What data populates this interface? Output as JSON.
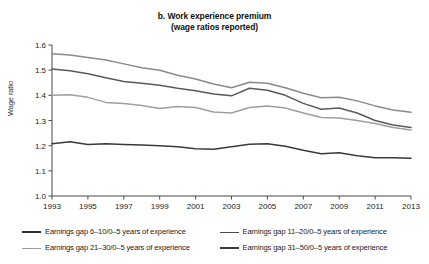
{
  "figure": {
    "title_lines": [
      "b. Work experience premium",
      "(wage ratios reported)"
    ]
  },
  "chart_data": {
    "type": "line",
    "title": "b. Work experience premium (wage ratios reported)",
    "xlabel": "",
    "ylabel": "Wage ratio",
    "xlim": [
      1993,
      2013
    ],
    "ylim": [
      1.0,
      1.6
    ],
    "grid": false,
    "legend_position": "bottom",
    "x": [
      1993,
      1994,
      1995,
      1996,
      1997,
      1998,
      1999,
      2000,
      2001,
      2002,
      2003,
      2004,
      2005,
      2006,
      2007,
      2008,
      2009,
      2010,
      2011,
      2012,
      2013
    ],
    "xticks": [
      1993,
      1995,
      1997,
      1999,
      2001,
      2003,
      2005,
      2007,
      2009,
      2011,
      2013
    ],
    "xtick_labels": [
      "1993",
      "1995",
      "1997",
      "1999",
      "2001",
      "2003",
      "2005",
      "2007",
      "2009",
      "2011",
      "2013"
    ],
    "yticks": [
      1.0,
      1.1,
      1.2,
      1.3,
      1.4,
      1.5,
      1.6
    ],
    "ytick_labels": [
      "1.0",
      "1.1",
      "1.2",
      "1.3",
      "1.4",
      "1.5",
      "1.6"
    ],
    "series": [
      {
        "name": "Earnings gap 6–10/0–5 years of experience",
        "color": "#8a8a8a",
        "width": 1.5,
        "values": [
          1.565,
          1.56,
          1.55,
          1.54,
          1.525,
          1.51,
          1.5,
          1.48,
          1.465,
          1.445,
          1.43,
          1.452,
          1.448,
          1.43,
          1.408,
          1.39,
          1.392,
          1.378,
          1.358,
          1.342,
          1.333
        ]
      },
      {
        "name": "Earnings gap 11–20/0–5 years of experience",
        "color": "#5a5a5a",
        "width": 1.5,
        "values": [
          1.505,
          1.498,
          1.486,
          1.47,
          1.455,
          1.448,
          1.44,
          1.428,
          1.418,
          1.405,
          1.398,
          1.428,
          1.42,
          1.4,
          1.368,
          1.345,
          1.35,
          1.33,
          1.3,
          1.282,
          1.272
        ]
      },
      {
        "name": "Earnings gap 21–30/0–5 years of experience",
        "color": "#9e9e9e",
        "width": 1.5,
        "values": [
          1.4,
          1.402,
          1.392,
          1.372,
          1.368,
          1.36,
          1.348,
          1.356,
          1.352,
          1.334,
          1.33,
          1.352,
          1.358,
          1.35,
          1.33,
          1.312,
          1.31,
          1.3,
          1.288,
          1.272,
          1.262
        ]
      },
      {
        "name": "Earnings gap 31–50/0–5 years of experience",
        "color": "#3a3a3a",
        "width": 1.5,
        "values": [
          1.208,
          1.216,
          1.205,
          1.208,
          1.205,
          1.203,
          1.2,
          1.196,
          1.188,
          1.186,
          1.196,
          1.206,
          1.208,
          1.198,
          1.182,
          1.168,
          1.172,
          1.16,
          1.152,
          1.152,
          1.15
        ]
      }
    ]
  },
  "legend": {
    "items": [
      {
        "label": "Earnings gap 6–10/0–5 years of experience",
        "color": "#2e2e2e",
        "width": 2.2
      },
      {
        "label": "Earnings gap 11–20/0–5 years of experience",
        "color": "#4a4a4a",
        "width": 1.8
      },
      {
        "label": "Earnings gap 21–30/0–5 years of experience",
        "color": "#9a9a9a",
        "width": 1.4
      },
      {
        "label": "Earnings gap 31–50/0–5 years of experience",
        "color": "#3a3a3a",
        "width": 2.0
      }
    ]
  },
  "axis_style": {
    "line_color": "#4a4a4a",
    "tick_color": "#4a4a4a"
  }
}
